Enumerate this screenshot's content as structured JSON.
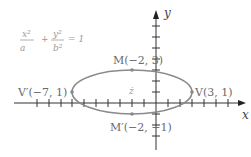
{
  "diagram": {
    "type": "ellipse-graph",
    "equation_handwritten": {
      "term1_num": "x²",
      "term1_den": "a",
      "plus": "+",
      "term2_num": "y²",
      "term2_den": "b²",
      "equals": "= 1"
    },
    "center_mark": "ż",
    "axes": {
      "x_label": "x",
      "y_label": "y"
    },
    "points": [
      {
        "id": "M",
        "label": "M(−2, 3)",
        "x": -2,
        "y": 3
      },
      {
        "id": "M_prime",
        "label": "M′(−2, −1)",
        "x": -2,
        "y": -1
      },
      {
        "id": "V_prime",
        "label": "V′(−7, 1)",
        "x": -7,
        "y": 1
      },
      {
        "id": "V",
        "label": "V(3, 1)",
        "x": 3,
        "y": 1
      }
    ],
    "ellipse": {
      "center": [
        -2,
        1
      ],
      "semi_major": 5,
      "semi_minor": 2
    },
    "colors": {
      "curve": "#8a8a8a",
      "axis": "#333333",
      "point": "#888888"
    }
  }
}
